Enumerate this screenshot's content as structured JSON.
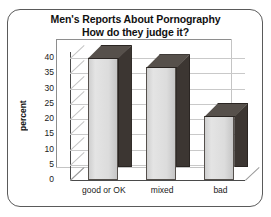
{
  "chart_data": {
    "type": "bar",
    "title": "Men's Reports About Pornography",
    "subtitle": "How do they judge it?",
    "categories": [
      "good or OK",
      "mixed",
      "bad"
    ],
    "values": [
      40,
      37,
      21
    ],
    "xlabel": "",
    "ylabel": "percent",
    "ylim": [
      0,
      40
    ],
    "yticks": [
      0,
      5,
      10,
      15,
      20,
      25,
      30,
      35,
      40
    ],
    "ytick_labels": [
      "0",
      "5",
      "10",
      "15",
      "20",
      "25",
      "30",
      "35",
      "40"
    ],
    "grid": true,
    "legend": "none",
    "style": "3d-column",
    "colors": {
      "bar_front": "#dcdcdc",
      "bar_side": "#3c3632",
      "bar_top": "#56504b",
      "gridline": "#c9c9c9",
      "axis": "#4a4a4a",
      "text": "#111111",
      "frame": "#5a5a5a",
      "background": "#ffffff"
    }
  }
}
